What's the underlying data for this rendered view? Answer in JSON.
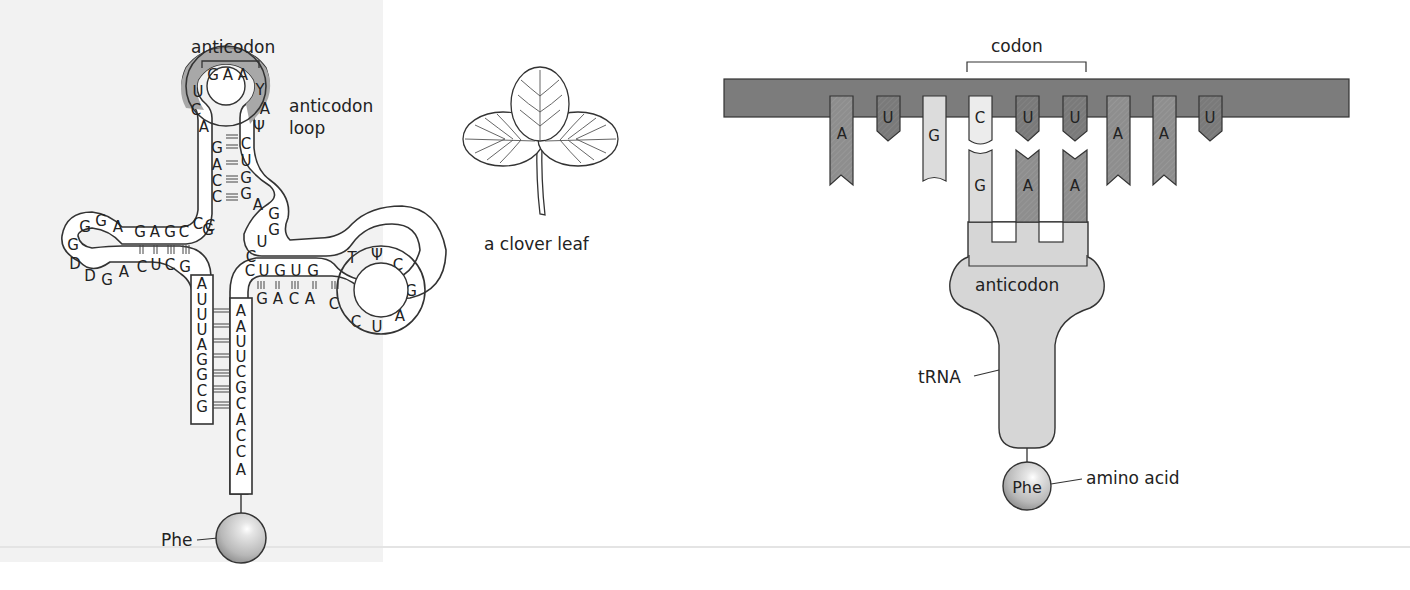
{
  "figure": {
    "left_diagram": {
      "title": "tRNA cloverleaf structure",
      "labels": {
        "anticodon": "anticodon",
        "anticodon_loop_line1": "anticodon",
        "anticodon_loop_line2": "loop",
        "amino_acid": "Phe"
      },
      "anticodon_loop": {
        "nucleotides": [
          "U",
          "G",
          "A",
          "A",
          "Y",
          "A",
          "Ψ",
          "C",
          "A"
        ],
        "anticodon_bases": [
          "G",
          "A",
          "A"
        ],
        "fill_color": "#a8a8a8"
      },
      "anticodon_stem": {
        "left_strand": [
          "G",
          "A",
          "C",
          "C",
          "C"
        ],
        "right_strand": [
          "C",
          "U",
          "G",
          "G",
          "G"
        ]
      },
      "variable_loop": [
        "A",
        "G",
        "G",
        "U",
        "C"
      ],
      "d_arm": {
        "top_strand": [
          "G",
          "A",
          "G",
          "C"
        ],
        "bottom_strand": [
          "C",
          "U",
          "C",
          "G"
        ],
        "loop": [
          "G",
          "G",
          "A",
          "G",
          "D",
          "D",
          "G",
          "A"
        ],
        "junction": [
          "C",
          "G"
        ]
      },
      "t_arm": {
        "top_strand": [
          "C",
          "U",
          "G",
          "U",
          "G"
        ],
        "bottom_strand": [
          "G",
          "A",
          "C",
          "A",
          "C"
        ],
        "loop": [
          "T",
          "Ψ",
          "C",
          "G",
          "A",
          "U",
          "C"
        ]
      },
      "acceptor_stem": {
        "left_strand": [
          "A",
          "U",
          "U",
          "U",
          "A",
          "G",
          "G",
          "C",
          "G"
        ],
        "right_strand": [
          "A",
          "A",
          "U",
          "U",
          "C",
          "G",
          "C",
          "A",
          "C",
          "C",
          "A"
        ]
      }
    },
    "middle_diagram": {
      "caption": "a clover leaf"
    },
    "right_diagram": {
      "title": "codon–anticodon pairing",
      "labels": {
        "codon": "codon",
        "anticodon": "anticodon",
        "trna": "tRNA",
        "amino_acid_label": "amino acid",
        "amino_acid": "Phe"
      },
      "mrna_bases": [
        "A",
        "U",
        "G",
        "C",
        "U",
        "U",
        "A",
        "A",
        "U"
      ],
      "codon_bases": [
        "C",
        "U",
        "U"
      ],
      "anticodon_bases": [
        "G",
        "A",
        "A"
      ],
      "colors": {
        "mrna_strand": "#7c7c7c",
        "purine": "#8e8e8e",
        "pyrimidine_U": "#7a7a7a",
        "light_base": "#dcdcdc",
        "trna_body": "#d6d6d6"
      }
    }
  }
}
